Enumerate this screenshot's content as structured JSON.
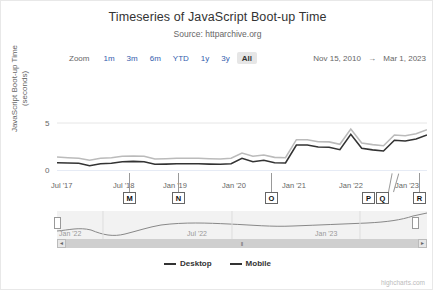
{
  "chart_data": {
    "type": "line",
    "title": "Timeseries of JavaScript Boot-up Time",
    "subtitle": "Source: httparchive.org",
    "xlabel": "",
    "ylabel": "JavaScript Boot-up Time (seconds)",
    "ylim": [
      0,
      7.5
    ],
    "yticks": [
      "0",
      "5"
    ],
    "grid": false,
    "legend_position": "bottom",
    "xticks": [
      "Jul '17",
      "Jul '18",
      "Jan '19",
      "Jan '20",
      "Jan '21",
      "Jan '22",
      "Jan '23"
    ],
    "series": [
      {
        "name": "Desktop",
        "color": "#333333",
        "x": [
          "2017-07",
          "2017-09",
          "2017-11",
          "2018-01",
          "2018-03",
          "2018-05",
          "2018-07",
          "2018-09",
          "2018-11",
          "2019-01",
          "2019-03",
          "2019-05",
          "2019-07",
          "2019-09",
          "2019-11",
          "2020-01",
          "2020-03",
          "2020-05",
          "2020-07",
          "2020-09",
          "2020-11",
          "2021-01",
          "2021-03",
          "2021-05",
          "2021-07",
          "2021-09",
          "2021-11",
          "2022-01",
          "2022-03",
          "2022-05",
          "2022-07",
          "2022-09",
          "2022-11",
          "2023-01",
          "2023-03"
        ],
        "values": [
          0.62,
          0.6,
          0.58,
          0.4,
          0.55,
          0.58,
          0.7,
          0.72,
          0.7,
          0.5,
          0.52,
          0.55,
          0.55,
          0.55,
          0.52,
          0.5,
          0.55,
          0.95,
          0.7,
          0.8,
          0.62,
          0.6,
          1.95,
          1.95,
          1.8,
          1.78,
          1.6,
          2.75,
          1.7,
          1.58,
          1.5,
          2.3,
          2.25,
          2.4,
          2.7
        ]
      },
      {
        "name": "Mobile",
        "color": "#333333",
        "x": [
          "2017-07",
          "2017-09",
          "2017-11",
          "2018-01",
          "2018-03",
          "2018-05",
          "2018-07",
          "2018-09",
          "2018-11",
          "2019-01",
          "2019-03",
          "2019-05",
          "2019-07",
          "2019-09",
          "2019-11",
          "2020-01",
          "2020-03",
          "2020-05",
          "2020-07",
          "2020-09",
          "2020-11",
          "2021-01",
          "2021-03",
          "2021-05",
          "2021-07",
          "2021-09",
          "2021-11",
          "2022-01",
          "2022-03",
          "2022-05",
          "2022-07",
          "2022-09",
          "2022-11",
          "2023-01",
          "2023-03"
        ],
        "values": [
          1.05,
          1.0,
          0.95,
          0.8,
          0.95,
          1.0,
          1.1,
          1.12,
          1.1,
          0.9,
          0.92,
          0.95,
          0.95,
          0.95,
          0.92,
          0.9,
          0.95,
          1.35,
          1.1,
          1.2,
          1.02,
          1.0,
          2.35,
          2.35,
          2.2,
          2.18,
          2.0,
          3.15,
          2.1,
          1.98,
          1.9,
          2.7,
          2.65,
          2.8,
          3.1
        ]
      }
    ],
    "flags": [
      {
        "label": "M",
        "x_pct": 19.5
      },
      {
        "label": "N",
        "x_pct": 32.8
      },
      {
        "label": "O",
        "x_pct": 58.0
      },
      {
        "label": "P",
        "x_pct": 89.5
      },
      {
        "label": "Q",
        "x_pct": 94.2
      },
      {
        "label": "R",
        "x_pct": 99.5
      }
    ]
  },
  "range_selector": {
    "label": "Zoom",
    "buttons": [
      {
        "label": "1m",
        "selected": false
      },
      {
        "label": "3m",
        "selected": false
      },
      {
        "label": "6m",
        "selected": false
      },
      {
        "label": "YTD",
        "selected": false
      },
      {
        "label": "1y",
        "selected": false
      },
      {
        "label": "3y",
        "selected": false
      },
      {
        "label": "All",
        "selected": true
      }
    ],
    "date_from": "Nov 15, 2010",
    "date_arrow": "→",
    "date_to": "Mar 1, 2023"
  },
  "navigator": {
    "ticks": [
      "Jan '22",
      "Jul '22",
      "Jan '23"
    ],
    "scroll_left_icon": "◄",
    "scroll_right_icon": "►",
    "grip_icon": "‖"
  },
  "legend": {
    "items": [
      {
        "label": "Desktop"
      },
      {
        "label": "Mobile"
      }
    ]
  },
  "credit": "highcharts.com"
}
